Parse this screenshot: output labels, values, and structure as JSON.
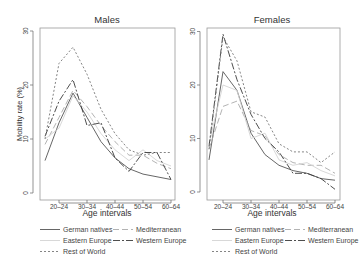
{
  "chart_data": [
    {
      "type": "line",
      "title": "Males",
      "xlabel": "Age intervals",
      "ylabel": "Mobility rate (%)",
      "ylim": [
        0,
        30
      ],
      "yticks": [
        0,
        10,
        20,
        30
      ],
      "x": [
        "15-19",
        "20-24",
        "25-29",
        "30-34",
        "35-39",
        "40-44",
        "45-49",
        "50-54",
        "55-59",
        "60-64"
      ],
      "xtick_labels": [
        "20-24",
        "30-34",
        "40-44",
        "50-54",
        "60-64"
      ],
      "grid": false,
      "series": [
        {
          "name": "German natives",
          "values": [
            6,
            13,
            18.5,
            14,
            9.5,
            6.5,
            4.5,
            3.5,
            3,
            2.5
          ]
        },
        {
          "name": "Mediterranean",
          "values": [
            9,
            14,
            19,
            16,
            12.5,
            9.5,
            7,
            7,
            5.5,
            4.5
          ]
        },
        {
          "name": "Eastern Europe",
          "values": [
            10,
            12,
            18,
            15,
            11,
            8,
            6,
            8,
            6,
            5
          ]
        },
        {
          "name": "Western Europe",
          "values": [
            10.5,
            17,
            21,
            12.5,
            13,
            6.5,
            4,
            7.5,
            7.5,
            2.5
          ]
        },
        {
          "name": "Rest of World",
          "values": [
            10,
            24,
            27,
            22,
            15.5,
            11,
            8,
            7,
            7.5,
            7.5
          ]
        }
      ]
    },
    {
      "type": "line",
      "title": "Females",
      "xlabel": "Age intervals",
      "ylabel": "",
      "ylim": [
        0,
        30
      ],
      "yticks": [
        0,
        10,
        20,
        30
      ],
      "x": [
        "15-19",
        "20-24",
        "25-29",
        "30-34",
        "35-39",
        "40-44",
        "45-49",
        "50-54",
        "55-59",
        "60-64"
      ],
      "xtick_labels": [
        "20-24",
        "30-34",
        "40-44",
        "50-54",
        "60-64"
      ],
      "grid": false,
      "series": [
        {
          "name": "German natives",
          "values": [
            6,
            22.5,
            19,
            11,
            7,
            5,
            4,
            3.5,
            2.5,
            2.2
          ]
        },
        {
          "name": "Mediterranean",
          "values": [
            8,
            16,
            17,
            11.5,
            10.5,
            7,
            5.5,
            5,
            5,
            3.5
          ]
        },
        {
          "name": "Eastern Europe",
          "values": [
            9,
            20,
            19,
            10,
            11,
            6,
            5,
            5.5,
            4,
            3
          ]
        },
        {
          "name": "Western Europe",
          "values": [
            8.5,
            29.5,
            21,
            14.5,
            10,
            7.5,
            3.5,
            3.5,
            2.5,
            0.5
          ]
        },
        {
          "name": "Rest of World",
          "values": [
            8,
            29,
            24.5,
            15,
            14,
            9,
            7.5,
            7.5,
            5.5,
            7.5
          ]
        }
      ]
    }
  ],
  "legend": {
    "position": "bottom",
    "entries": [
      "German natives",
      "Mediterranean",
      "Eastern Europe",
      "Western Europe",
      "Rest of World"
    ]
  },
  "styles": {
    "German natives": {
      "color": "#555555",
      "dash": ""
    },
    "Mediterranean": {
      "color": "#aaaaaa",
      "dash": "6,3"
    },
    "Eastern Europe": {
      "color": "#d4d4d4",
      "dash": ""
    },
    "Western Europe": {
      "color": "#3a3a3a",
      "dash": "7,2,2,2"
    },
    "Rest of World": {
      "color": "#777777",
      "dash": "2,2"
    }
  }
}
